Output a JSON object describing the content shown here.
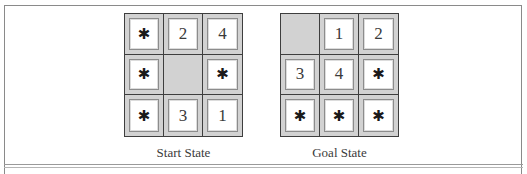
{
  "figure": {
    "blank_symbol": "",
    "wildcard_symbol": "✱",
    "start_state": {
      "label": "Start State",
      "cells": [
        [
          "*",
          "2",
          "4"
        ],
        [
          "*",
          "",
          "*"
        ],
        [
          "*",
          "3",
          "1"
        ]
      ]
    },
    "goal_state": {
      "label": "Goal State",
      "cells": [
        [
          "",
          "1",
          "2"
        ],
        [
          "3",
          "4",
          "*"
        ],
        [
          "*",
          "*",
          "*"
        ]
      ]
    }
  },
  "colors": {
    "cell_background": "#d2d2d2",
    "tile_background": "#ffffff",
    "grid_line": "#3e3e3e"
  }
}
